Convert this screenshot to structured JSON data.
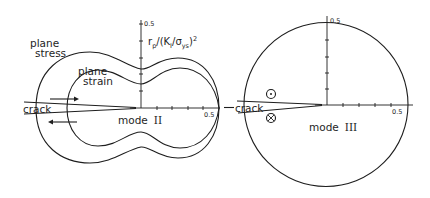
{
  "left_panel": {
    "y_axis_label": "r_p/(K_I/σ_ys)²",
    "y_axis_label_parts": {
      "r": "r",
      "p": "p",
      "mid": "/(K",
      "one": "I",
      "slash": "/σ",
      "ys": "ys",
      "close": ")",
      "sq": "2"
    },
    "y_tick_top": "0.5",
    "x_tick_right": "0.5",
    "curve_outer_label_line1": "plane",
    "curve_outer_label_line2": "stress",
    "curve_inner_label_line1": "plane",
    "curve_inner_label_line2": "strain",
    "crack_label": "crack",
    "mode_label": "mode",
    "mode_numeral": "II",
    "arrows": [
      "right-arrow-upper-face",
      "left-arrow-lower-face"
    ]
  },
  "right_panel": {
    "y_tick_top": "0.5",
    "x_tick_right": "0.5",
    "crack_label": "crack",
    "mode_label": "mode",
    "mode_numeral": "III",
    "symbols": [
      "out-of-plane-dot",
      "into-plane-cross"
    ]
  },
  "colors": {
    "ink": "#1e1e1e",
    "background": "#ffffff"
  }
}
